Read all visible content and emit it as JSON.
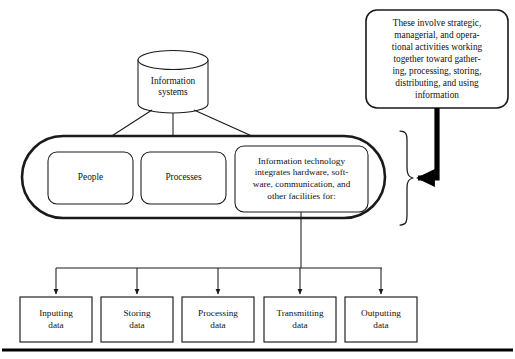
{
  "diagram": {
    "source_cylinder": {
      "label": "Information\nsystems",
      "shape": "cylinder"
    },
    "callout": {
      "label": "These involve strategic,\nmanagerial, and opera-\ntional activities working\ntogether toward gather-\ning, processing, storing,\ndistributing, and using\ninformation",
      "shape": "rounded-rectangle"
    },
    "container": {
      "shape": "stadium",
      "label": ""
    },
    "components": [
      {
        "label": "People"
      },
      {
        "label": "Processes"
      },
      {
        "label": "Information technology\nintegrates hardware, soft-\nware, communication, and\nother facilities for:"
      }
    ],
    "functions": [
      {
        "label": "Inputting\ndata"
      },
      {
        "label": "Storing\ndata"
      },
      {
        "label": "Processing\ndata"
      },
      {
        "label": "Transmitting\ndata"
      },
      {
        "label": "Outputting\ndata"
      }
    ],
    "colors": {
      "stroke": "#1a1a1a",
      "thick_stroke": "#000000",
      "background": "#ffffff",
      "text": "#111111"
    }
  }
}
